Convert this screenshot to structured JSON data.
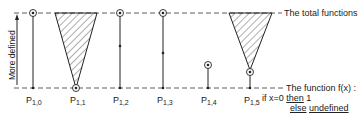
{
  "diagram": {
    "y_axis_label": "More defined",
    "top_line_label": "The total functions",
    "bottom_line_label": {
      "line1": "The function f(x) :",
      "line2_prefix": "if x=0",
      "line2_then": "then",
      "line2_value": "1",
      "line3_else": "else",
      "line3_undefined": "undefined"
    },
    "columns": [
      {
        "id": "P1,0",
        "label_main": "P",
        "label_sub": "1,0",
        "shape": "line",
        "top_point": "circled",
        "bottom_point": "dot"
      },
      {
        "id": "P1,1",
        "label_main": "P",
        "label_sub": "1,1",
        "shape": "inverted-hatched-triangle",
        "apex_point": "circled"
      },
      {
        "id": "P1,2",
        "label_main": "P",
        "label_sub": "1,2",
        "shape": "line",
        "top_point": "circled",
        "middle_point": "dot",
        "bottom_point": "dot"
      },
      {
        "id": "P1,3",
        "label_main": "P",
        "label_sub": "1,3",
        "shape": "line",
        "top_point": "circled",
        "middle_point": "dot",
        "bottom_point": "dot"
      },
      {
        "id": "P1,4",
        "label_main": "P",
        "label_sub": "1,4",
        "shape": "short-line",
        "top_point": "circled",
        "bottom_point": "dot"
      },
      {
        "id": "P1,5",
        "label_main": "P",
        "label_sub": "1,5",
        "shape": "inverted-hatched-triangle-raised",
        "apex_point": "circled",
        "bottom_point": "dot"
      }
    ],
    "colors": {
      "ink": "#222222",
      "background": "#ffffff"
    }
  }
}
